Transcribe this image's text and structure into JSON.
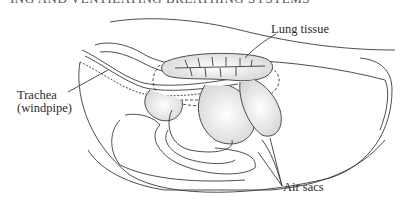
{
  "header": {
    "running_title": "ING AND VENTILATING BREATHING SYSTEMS"
  },
  "diagram": {
    "labels": {
      "lung_tissue": "Lung tissue",
      "trachea_line1": "Trachea",
      "trachea_line2": "(windpipe)",
      "air_sacs": "Air sacs"
    },
    "colors": {
      "line": "#3a3a3a",
      "shade": "#d9d9d9",
      "background": "#ffffff"
    }
  }
}
